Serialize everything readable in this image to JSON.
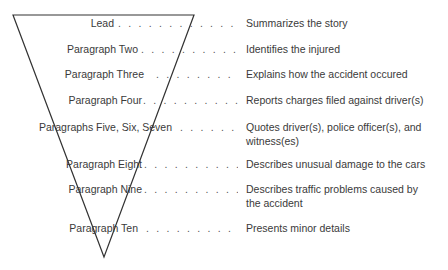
{
  "diagram": {
    "shape": "inverted-triangle",
    "colors": {
      "line": "#333333",
      "text": "#3a3a3a",
      "background": "#ffffff"
    },
    "rows": [
      {
        "part": "Lead",
        "description": "Summarizes the story"
      },
      {
        "part": "Paragraph Two",
        "description": "Identifies the injured"
      },
      {
        "part": "Paragraph Three",
        "description": "Explains how the accident occured"
      },
      {
        "part": "Paragraph Four",
        "description": "Reports charges filed against driver(s)"
      },
      {
        "part": "Paragraphs Five, Six, Seven",
        "description": "Quotes driver(s), police officer(s), and witness(es)"
      },
      {
        "part": "Paragraph Eight",
        "description": "Describes unusual damage to the cars"
      },
      {
        "part": "Paragraph Nine",
        "description": "Describes traffic problems caused by the accident"
      },
      {
        "part": "Paragraph Ten",
        "description": "Presents minor details"
      }
    ],
    "leader": ". . . . . . . . . . . . . . . . . . . . . . . . . . . . ."
  }
}
